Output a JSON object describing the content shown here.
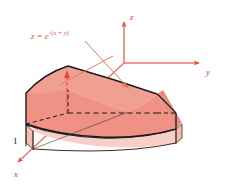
{
  "figure": {
    "caption_type": "3d-solid-region-diagram",
    "background_color": "#ffffff",
    "axes": {
      "color": "#e8776a",
      "origin": {
        "x": 124,
        "y": 63
      },
      "labels": {
        "z": "z",
        "y": "y",
        "x": "x"
      },
      "z_axis": {
        "from": [
          124,
          63
        ],
        "to": [
          124,
          18
        ],
        "arrow": "up"
      },
      "y_axis": {
        "from": [
          124,
          63
        ],
        "to": [
          203,
          63
        ],
        "arrow": "right"
      },
      "x_axis": {
        "from": [
          124,
          63
        ],
        "to": [
          14,
          166
        ],
        "arrow": "down-left"
      }
    },
    "surface_label": {
      "text": "z = e",
      "exponent": "-(x + y)",
      "color": "#d8453a",
      "leader_lines": [
        {
          "from": [
            86,
            40
          ],
          "to": [
            128,
            88
          ]
        },
        {
          "from": [
            112,
            55
          ],
          "to": [
            58,
            84
          ]
        }
      ]
    },
    "tick_label": {
      "text": "1",
      "axis": "x",
      "color": "#1a1a1a"
    },
    "solid": {
      "description": "Solid under the surface z = e^-(x+y) over the unit square 0<=x<=1, 0<=y<=1",
      "top_surface_fill": "#ef9185",
      "front_face_fill": "#f0a093",
      "left_face_fill": "#e98d80",
      "base_slab_fill": "#f7cfc7",
      "base_slab_side_fill": "#f2bdb2",
      "outline_color": "#1a1a1a",
      "hidden_edge_style": "dashed",
      "hidden_edge_color": "#1a1a1a"
    },
    "height_marker": {
      "color": "#e8453a",
      "style": "dashed-vertical",
      "from": [
        67,
        78
      ],
      "to": [
        67,
        113
      ]
    }
  }
}
